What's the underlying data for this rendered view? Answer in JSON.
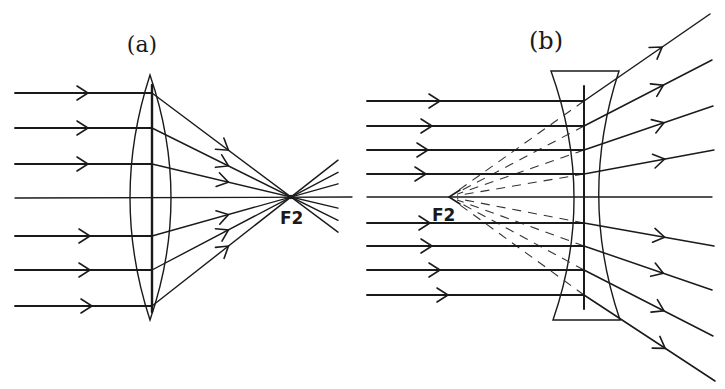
{
  "diagram": {
    "panel_a": {
      "caption": "(a)",
      "lens_type": "converging (convex) lens",
      "focal_label": "F2",
      "incident_ray_count": 7,
      "description": "Parallel rays refracted by a convex lens converge to the real focal point F2"
    },
    "panel_b": {
      "caption": "(b)",
      "lens_type": "diverging (concave) lens",
      "focal_label": "F2",
      "incident_ray_count": 9,
      "description": "Parallel rays refracted by a concave lens diverge; dashed back-extensions meet at the virtual focal point F2"
    },
    "colors": {
      "ink": "#1a1a1a",
      "background": "#ffffff"
    }
  }
}
